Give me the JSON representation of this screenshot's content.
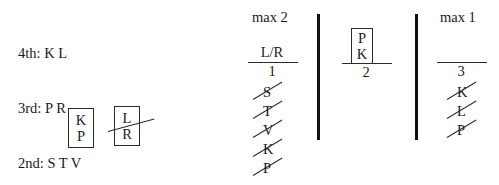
{
  "legend": {
    "name": "rank-legend",
    "rows": [
      "4th: K L",
      "3rd: P R",
      "2nd: S T V"
    ]
  },
  "boxes": [
    {
      "name": "box-kp",
      "top_letter": "K",
      "bottom_letter": "P",
      "struck": false
    },
    {
      "name": "box-lr",
      "top_letter": "L",
      "bottom_letter": "R",
      "struck": true
    }
  ],
  "columns": [
    {
      "name": "column-1",
      "title": "max 2",
      "numerator": "L/R",
      "denominator": "1",
      "struck_letters": [
        "S",
        "T",
        "V",
        "K",
        "P"
      ]
    },
    {
      "name": "column-2",
      "title": "",
      "box": {
        "name": "box-pk",
        "top_letter": "P",
        "bottom_letter": "K"
      },
      "denominator": "2",
      "struck_letters": []
    },
    {
      "name": "column-3",
      "title": "max 1",
      "numerator": "",
      "denominator": "3",
      "struck_letters": [
        "K",
        "L",
        "P"
      ]
    }
  ],
  "dividers": [
    {
      "name": "divider-left"
    },
    {
      "name": "divider-right"
    }
  ],
  "colors": {
    "ink": "#1a1a1a",
    "rule": "#2b2b2b",
    "divider": "#111111",
    "background": "#ffffff"
  }
}
